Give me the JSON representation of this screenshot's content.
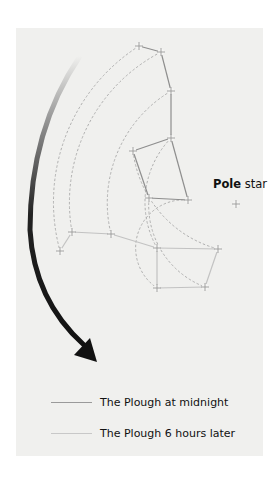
{
  "diagram": {
    "pole_star": {
      "label_bold": "Pole",
      "label_rest": " star"
    },
    "legend": [
      {
        "label": "The Plough at midnight",
        "line_color": "#9a9a9a"
      },
      {
        "label": "The Plough 6 hours later",
        "line_color": "#c8c8c8"
      }
    ],
    "constellations": {
      "midnight": {
        "name": "The Plough at midnight",
        "star_count": 7
      },
      "later": {
        "name": "The Plough 6 hours later",
        "star_count": 7
      }
    },
    "rotation_direction": "anticlockwise",
    "rotation_hours": 6
  }
}
